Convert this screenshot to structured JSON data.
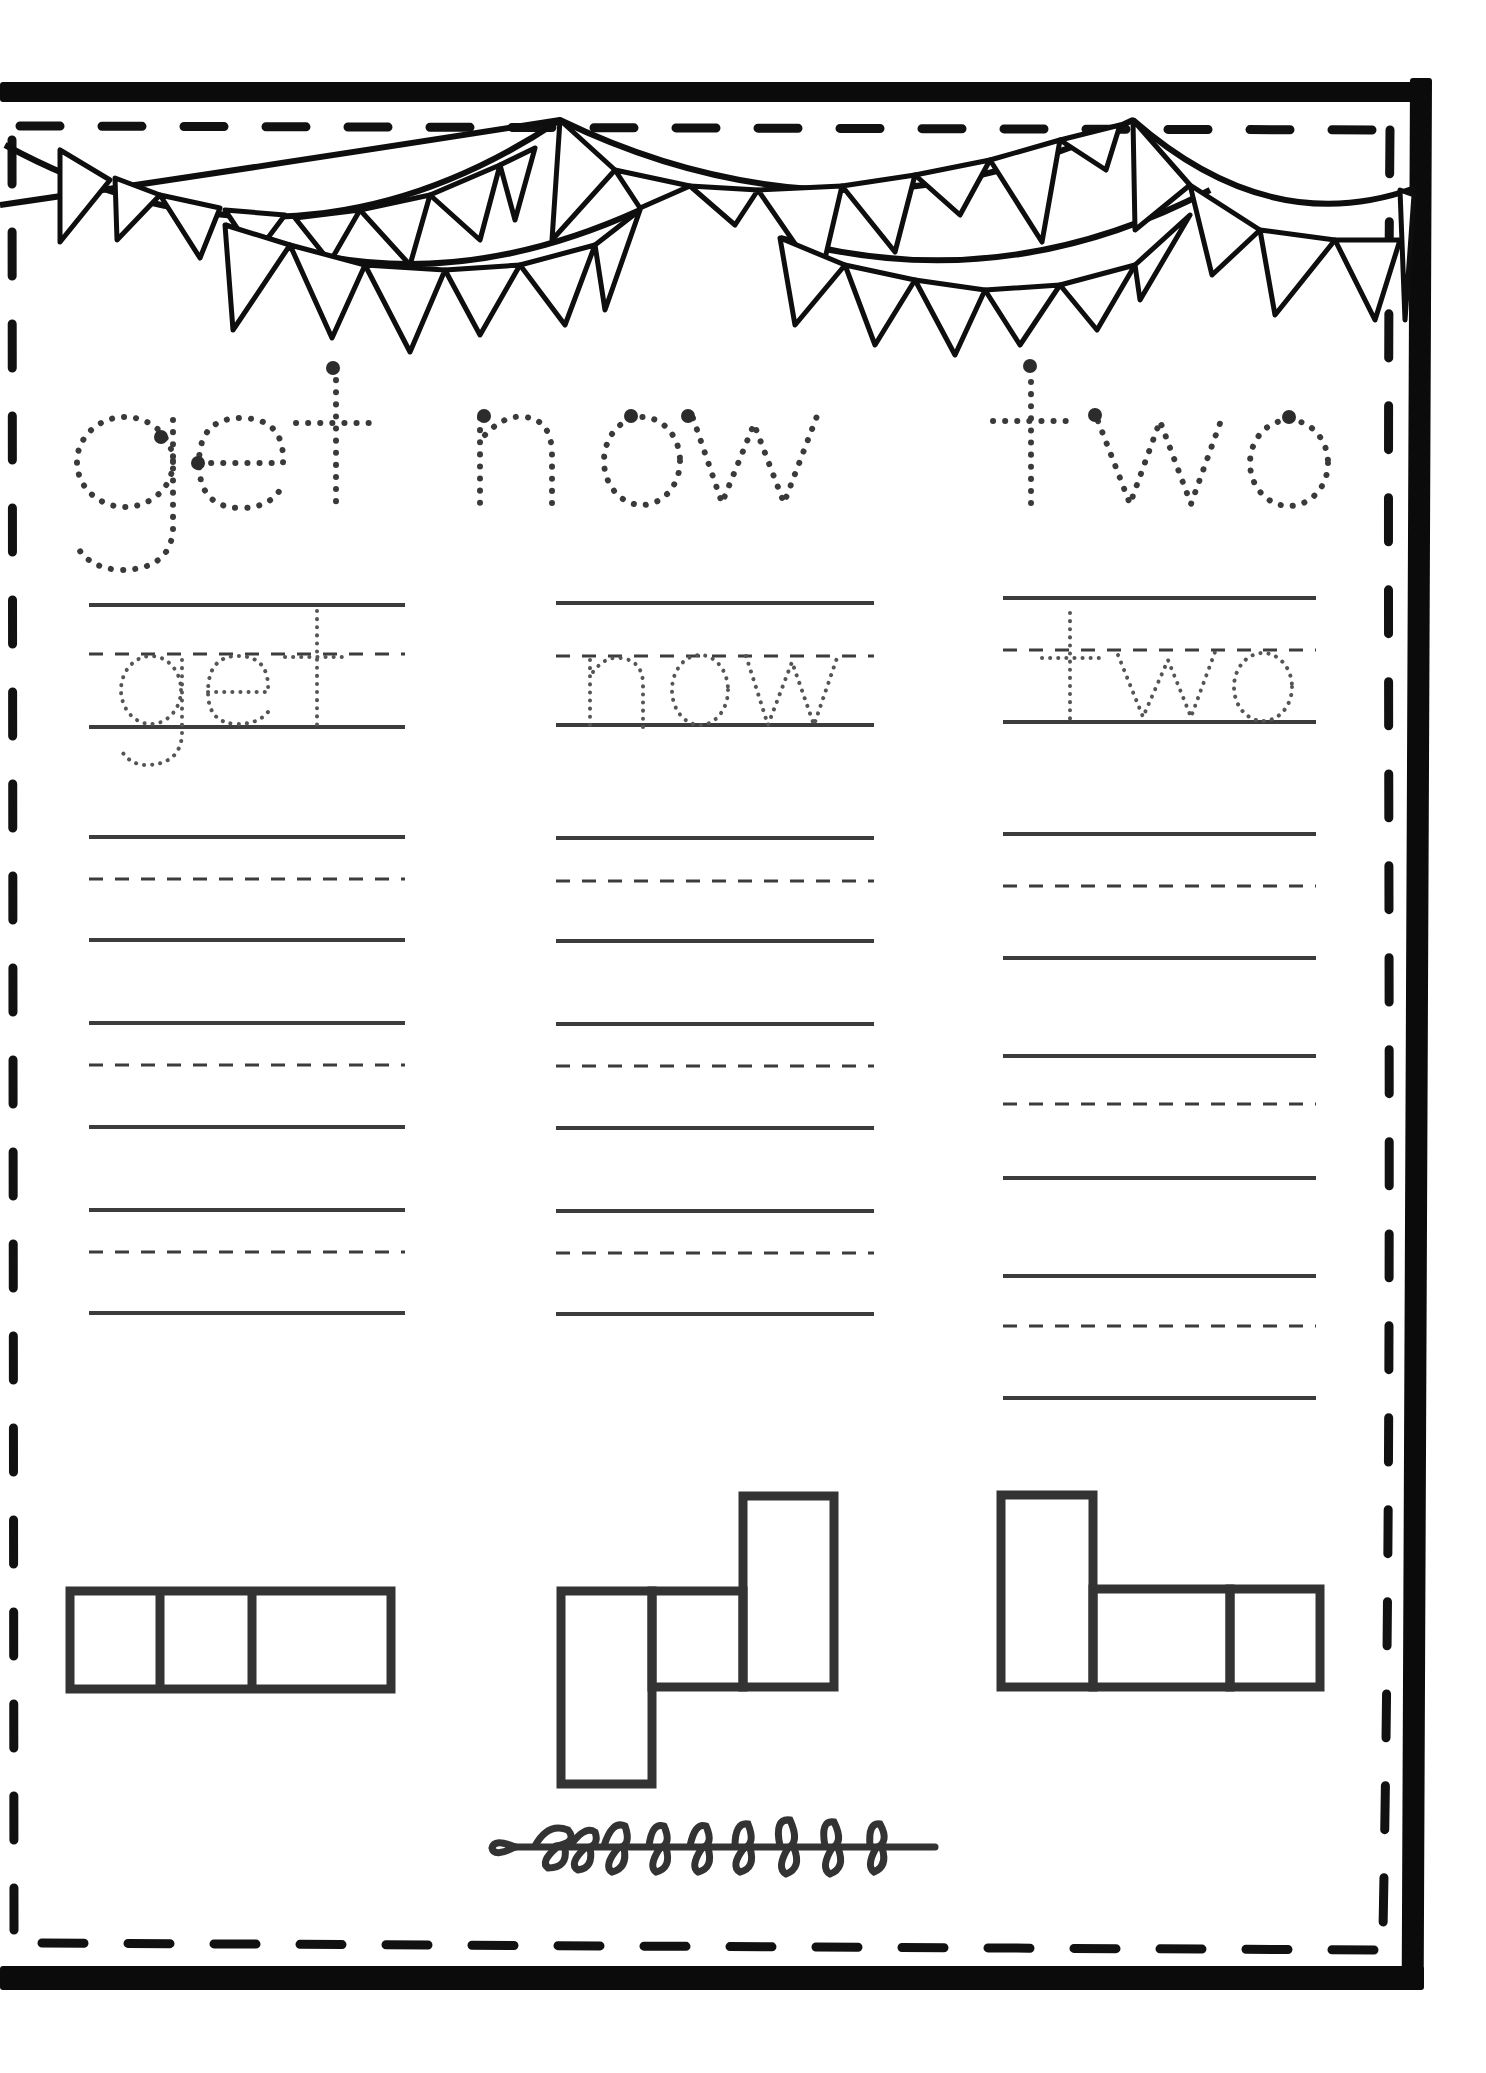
{
  "worksheet": {
    "type": "sight-word tracing worksheet",
    "words": [
      {
        "word": "get",
        "heading_text": "get",
        "trace_text": "get",
        "column": "left",
        "practice_rows": 4,
        "letter_boxes": [
          "short",
          "short",
          "tall"
        ],
        "letter_box_shape": "three boxes in a row: two small squares and a wider box"
      },
      {
        "word": "now",
        "heading_text": "now",
        "trace_text": "now",
        "column": "middle",
        "practice_rows": 4,
        "letter_boxes": [
          "descender",
          "short",
          "tall"
        ],
        "letter_box_shape": "descender box, small box, tall box"
      },
      {
        "word": "two",
        "heading_text": "two",
        "trace_text": "two",
        "column": "right",
        "practice_rows": 4,
        "letter_boxes": [
          "tall",
          "short",
          "short"
        ],
        "letter_box_shape": "tall box, wide box, small box"
      }
    ],
    "decorations": {
      "top": "bunting-flags-icon",
      "bottom": "leafy-vine-icon",
      "frame": "thick black frame with inner dashed border"
    },
    "colors": {
      "frame": "#0b0b0b",
      "lines": "#3c3c3c",
      "dotted_letters": "#3a3a3a",
      "start_dots": "#2c2c2c",
      "background": "#ffffff"
    }
  }
}
